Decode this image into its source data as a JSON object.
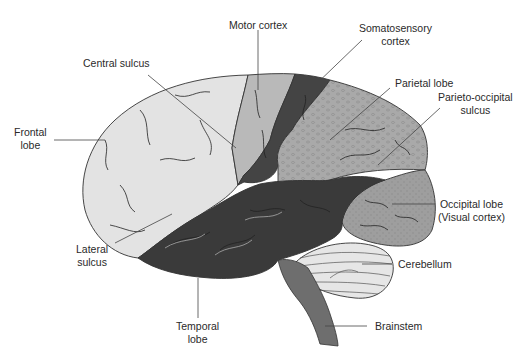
{
  "diagram": {
    "colors": {
      "frontal": "#e3e3e3",
      "motor": "#b9b9b9",
      "somatosensory": "#444444",
      "parietal": "#a9a9a9",
      "occipital": "#9e9e9e",
      "temporal": "#3a3a3a",
      "cerebellum": "#e6e6e6",
      "brainstem": "#6e6e6e",
      "outline": "#333333",
      "leader": "#444444"
    },
    "labels": {
      "frontal_lobe": [
        "Frontal",
        "lobe"
      ],
      "central_sulcus": "Central sulcus",
      "motor_cortex": "Motor cortex",
      "somatosensory_cortex": [
        "Somatosensory",
        "cortex"
      ],
      "parietal_lobe": "Parietal lobe",
      "parieto_occipital_sulcus": [
        "Parieto-occipital",
        "sulcus"
      ],
      "occipital_lobe": [
        "Occipital lobe",
        "(Visual cortex)"
      ],
      "cerebellum": "Cerebellum",
      "brainstem": "Brainstem",
      "temporal_lobe": [
        "Temporal",
        "lobe"
      ],
      "lateral_sulcus": [
        "Lateral",
        "sulcus"
      ]
    }
  }
}
